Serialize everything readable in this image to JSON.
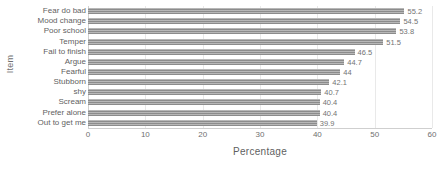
{
  "chart_data": {
    "type": "bar",
    "orientation": "horizontal",
    "title": "",
    "xlabel": "Percentage",
    "ylabel": "Item",
    "xlim": [
      0,
      60
    ],
    "xticks": [
      0,
      10,
      20,
      30,
      40,
      50,
      60
    ],
    "grid": true,
    "grid_axis": "x",
    "legend": false,
    "bar_color": "#8c8c8c",
    "bar_pattern": "horizontal-stripes",
    "categories": [
      "Fear do bad",
      "Mood change",
      "Poor school",
      "Temper",
      "Fail to finish",
      "Argue",
      "Fearful",
      "Stubborn",
      "shy",
      "Scream",
      "Prefer alone",
      "Out to get me"
    ],
    "values": [
      55.2,
      54.5,
      53.8,
      51.5,
      46.5,
      44.7,
      44,
      42.1,
      40.7,
      40.4,
      40.4,
      39.9
    ],
    "value_labels": [
      "55.2",
      "54.5",
      "53.8",
      "51.5",
      "46.5",
      "44.7",
      "44",
      "42.1",
      "40.7",
      "40.4",
      "40.4",
      "39.9"
    ]
  },
  "axes": {
    "x_title": "Percentage",
    "y_title": "Item",
    "x_tick_labels": [
      "0",
      "10",
      "20",
      "30",
      "40",
      "50",
      "60"
    ]
  }
}
